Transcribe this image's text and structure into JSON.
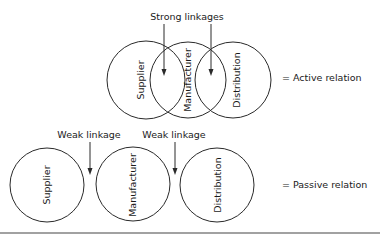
{
  "active": {
    "top_label": "Strong linkages",
    "circles": [
      {
        "label": "Supplier"
      },
      {
        "label": "Manufacturer"
      },
      {
        "label": "Distribution"
      }
    ],
    "legend": "= Active relation"
  },
  "passive": {
    "arrow_labels": [
      "Weak linkage",
      "Weak linkage"
    ],
    "circles": [
      {
        "label": "Supplier"
      },
      {
        "label": "Manufacturer"
      },
      {
        "label": "Distribution"
      }
    ],
    "legend": "= Passive relation"
  },
  "colors": {
    "stroke": "#2a2a2a",
    "text": "#1a1a1a",
    "background": "#ffffff"
  }
}
